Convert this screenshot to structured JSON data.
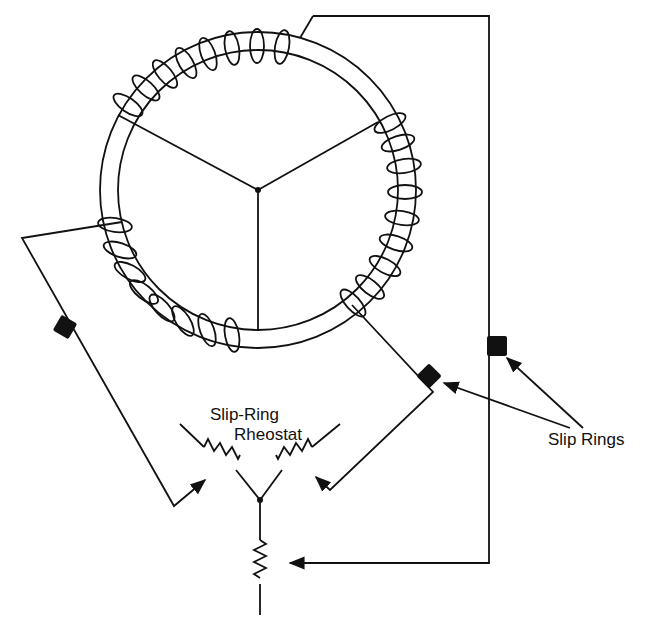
{
  "diagram": {
    "labels": {
      "rheostat_line1": "Slip-Ring",
      "rheostat_line2": "Rheostat",
      "slip_rings": "Slip Rings"
    },
    "colors": {
      "line": "#111111",
      "background": "#ffffff"
    },
    "components": [
      {
        "id": "rotor-ring",
        "type": "toroidal winding ring"
      },
      {
        "id": "wye-center",
        "type": "junction"
      },
      {
        "id": "slip-ring-left",
        "type": "slip ring"
      },
      {
        "id": "slip-ring-middle",
        "type": "slip ring"
      },
      {
        "id": "slip-ring-right",
        "type": "slip ring"
      },
      {
        "id": "rheostat-left",
        "type": "variable resistor"
      },
      {
        "id": "rheostat-right",
        "type": "variable resistor"
      },
      {
        "id": "rheostat-bottom",
        "type": "variable resistor"
      }
    ]
  }
}
